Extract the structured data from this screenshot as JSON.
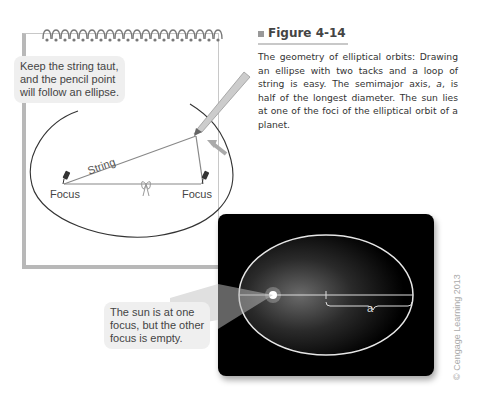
{
  "figure": {
    "title": "Figure 4-14",
    "caption_parts": {
      "before": "The geometry of elliptical orbits: Drawing an ellipse with two tacks and a loop of string is easy. The semimajor axis, ",
      "var": "a",
      "after": ", is half of the longest diameter. The sun lies at one of the foci of the elliptical orbit of a planet."
    }
  },
  "notepad": {
    "callout_lines": [
      "Keep the string taut,",
      "and the pencil point",
      "will follow an ellipse."
    ],
    "string_label": "String",
    "focus_left_label": "Focus",
    "focus_right_label": "Focus"
  },
  "orbit_panel": {
    "callout_lines": [
      "The sun is at one",
      "focus, but the other",
      "focus is empty."
    ],
    "semimajor_label": "a"
  },
  "credit": "© Cengage Learning 2013"
}
